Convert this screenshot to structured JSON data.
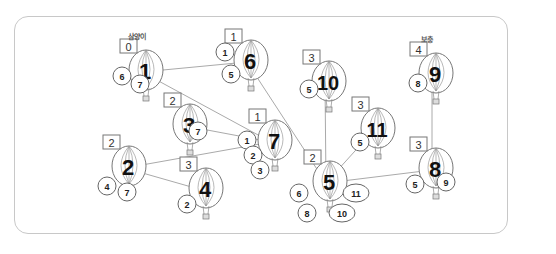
{
  "diagram": {
    "top_labels": [
      {
        "for": 1,
        "text": "삼양이"
      },
      {
        "for": 9,
        "text": "보충"
      }
    ],
    "balloons": [
      {
        "id": 1,
        "number": "1",
        "x": 142,
        "y": 72,
        "box": "0",
        "circles": [
          "6",
          "7"
        ]
      },
      {
        "id": 6,
        "number": "6",
        "x": 247,
        "y": 62,
        "box": "1",
        "circles": [
          "1",
          "5"
        ]
      },
      {
        "id": 10,
        "number": "10",
        "x": 325,
        "y": 83,
        "box": "3",
        "circles": [
          "5"
        ]
      },
      {
        "id": 9,
        "number": "9",
        "x": 432,
        "y": 75,
        "box": "4",
        "circles": [
          "8"
        ]
      },
      {
        "id": 3,
        "number": "3",
        "x": 186,
        "y": 126,
        "box": "2",
        "circles": [
          "7"
        ]
      },
      {
        "id": 7,
        "number": "7",
        "x": 271,
        "y": 142,
        "box": "1",
        "circles": [
          "1",
          "2",
          "3"
        ]
      },
      {
        "id": 11,
        "number": "11",
        "x": 374,
        "y": 130,
        "box": "3",
        "circles": [
          "5"
        ]
      },
      {
        "id": 2,
        "number": "2",
        "x": 125,
        "y": 168,
        "box": "2",
        "circles": [
          "4",
          "7"
        ]
      },
      {
        "id": 4,
        "number": "4",
        "x": 202,
        "y": 190,
        "box": "3",
        "circles": [
          "2"
        ]
      },
      {
        "id": 5,
        "number": "5",
        "x": 326,
        "y": 183,
        "box": "2",
        "circles": [
          "6",
          "11",
          "8",
          "10"
        ]
      },
      {
        "id": 8,
        "number": "8",
        "x": 432,
        "y": 170,
        "box": "3",
        "circles": [
          "5",
          "9"
        ]
      }
    ],
    "edges": [
      [
        1,
        6
      ],
      [
        1,
        7
      ],
      [
        6,
        5
      ],
      [
        10,
        5
      ],
      [
        11,
        5
      ],
      [
        5,
        8
      ],
      [
        9,
        8
      ],
      [
        3,
        7
      ],
      [
        2,
        7
      ],
      [
        2,
        4
      ]
    ]
  }
}
